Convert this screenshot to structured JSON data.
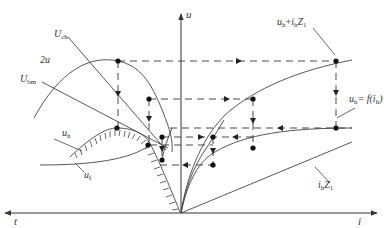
{
  "diagram": {
    "colors": {
      "stroke": "#333333",
      "dash": "#333333",
      "dot": "#111111",
      "background": "#ffffff"
    },
    "axes": {
      "vertical_label": "u",
      "left_label": "t",
      "right_label": "i"
    },
    "curve_labels": {
      "u_ch": {
        "main": "U",
        "sub": "ch"
      },
      "two_u": "2u",
      "u_bm": {
        "main": "U",
        "sub": "bm"
      },
      "u_h_left": {
        "main": "u",
        "sub": "h"
      },
      "u_f": {
        "main": "u",
        "sub": "f"
      },
      "u_h_plus": {
        "main": "u",
        "sub1": "h",
        "plus": "+",
        "i": "i",
        "sub2": "h",
        "Z": "Z",
        "sub3": "1"
      },
      "u_h_func": {
        "main": "u",
        "sub1": "h",
        "eq": "= f(i",
        "sub2": "h",
        "close": ")"
      },
      "i_h_z1": {
        "i": "i",
        "sub1": "h",
        "Z": "Z",
        "sub2": "1"
      }
    }
  }
}
